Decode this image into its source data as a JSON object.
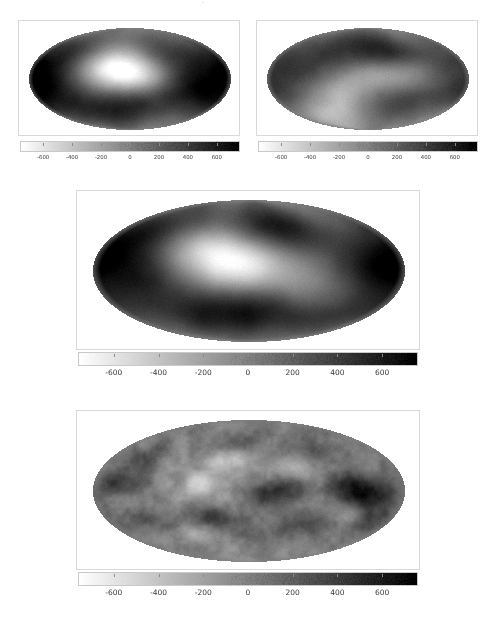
{
  "figure": {
    "background": "#ffffff",
    "top_mark": "·",
    "colormap": {
      "name": "gray-reversed",
      "low_color": "#ffffff",
      "high_color": "#000000",
      "description": "white at negative values, black at positive values"
    }
  },
  "chart_data": [
    {
      "id": "panel-top-left",
      "type": "heatmap",
      "projection": "mollweide",
      "title": "",
      "xlabel": "",
      "ylabel": "",
      "units": "µK",
      "grid": false,
      "frame": {
        "x": 18,
        "y": 20,
        "width": 222,
        "height": 116
      },
      "ellipse": {
        "cx": 111,
        "cy": 58,
        "rx": 101,
        "ry": 51
      },
      "zlim": [
        -750,
        750
      ],
      "colorbar": {
        "x": 20,
        "y": 141,
        "width": 220,
        "height": 11,
        "orientation": "horizontal",
        "ticks": [
          -600,
          -400,
          -200,
          0,
          200,
          400,
          600
        ],
        "tick_labels": [
          "-600",
          "-400",
          "-200",
          "0",
          "200",
          "400",
          "600"
        ],
        "range": [
          -760,
          760
        ],
        "font_size": 5.4
      },
      "noise_amp": 60,
      "noise_scale": 0.9,
      "blobs": [
        {
          "lon": -0.18,
          "lat": -0.08,
          "amp": -620,
          "sx": 0.3,
          "sy": 0.34
        },
        {
          "lon": -0.06,
          "lat": -0.3,
          "amp": -430,
          "sx": 0.26,
          "sy": 0.26
        },
        {
          "lon": 0.02,
          "lat": 0.46,
          "amp": 520,
          "sx": 0.36,
          "sy": 0.3
        },
        {
          "lon": -0.7,
          "lat": 0.1,
          "amp": 470,
          "sx": 0.3,
          "sy": 0.38
        },
        {
          "lon": 0.66,
          "lat": 0.06,
          "amp": 520,
          "sx": 0.28,
          "sy": 0.34
        },
        {
          "lon": -0.92,
          "lat": -0.3,
          "amp": 430,
          "sx": 0.26,
          "sy": 0.3
        },
        {
          "lon": 0.34,
          "lat": -0.52,
          "amp": 330,
          "sx": 0.34,
          "sy": 0.26
        },
        {
          "lon": -0.34,
          "lat": 0.72,
          "amp": 260,
          "sx": 0.34,
          "sy": 0.24
        },
        {
          "lon": 0.92,
          "lat": 0.46,
          "amp": 300,
          "sx": 0.26,
          "sy": 0.26
        },
        {
          "lon": -0.5,
          "lat": -0.66,
          "amp": 280,
          "sx": 0.3,
          "sy": 0.24
        },
        {
          "lon": 0.14,
          "lat": 0.02,
          "amp": -260,
          "sx": 0.18,
          "sy": 0.2
        }
      ]
    },
    {
      "id": "panel-top-right",
      "type": "heatmap",
      "projection": "mollweide",
      "title": "",
      "xlabel": "",
      "ylabel": "",
      "units": "µK",
      "grid": false,
      "frame": {
        "x": 256,
        "y": 20,
        "width": 222,
        "height": 116
      },
      "ellipse": {
        "cx": 111,
        "cy": 58,
        "rx": 101,
        "ry": 51
      },
      "zlim": [
        -750,
        750
      ],
      "colorbar": {
        "x": 258,
        "y": 141,
        "width": 220,
        "height": 11,
        "orientation": "horizontal",
        "ticks": [
          -600,
          -400,
          -200,
          0,
          200,
          400,
          600
        ],
        "tick_labels": [
          "-600",
          "-400",
          "-200",
          "0",
          "200",
          "400",
          "600"
        ],
        "range": [
          -760,
          760
        ],
        "font_size": 5.4
      },
      "noise_amp": 60,
      "noise_scale": 0.9,
      "blobs": [
        {
          "lon": 0.2,
          "lat": 0.44,
          "amp": 560,
          "sx": 0.3,
          "sy": 0.3
        },
        {
          "lon": 0.2,
          "lat": -0.52,
          "amp": 620,
          "sx": 0.28,
          "sy": 0.26
        },
        {
          "lon": -0.52,
          "lat": -0.22,
          "amp": 420,
          "sx": 0.34,
          "sy": 0.34
        },
        {
          "lon": 0.74,
          "lat": 0.1,
          "amp": 320,
          "sx": 0.3,
          "sy": 0.36
        },
        {
          "lon": -0.92,
          "lat": 0.34,
          "amp": 300,
          "sx": 0.26,
          "sy": 0.3
        },
        {
          "lon": -0.2,
          "lat": 0.3,
          "amp": -470,
          "sx": 0.34,
          "sy": 0.34
        },
        {
          "lon": 0.52,
          "lat": -0.1,
          "amp": -330,
          "sx": 0.3,
          "sy": 0.34
        },
        {
          "lon": -0.66,
          "lat": 0.7,
          "amp": -300,
          "sx": 0.34,
          "sy": 0.24
        },
        {
          "lon": 0.04,
          "lat": -0.12,
          "amp": -230,
          "sx": 0.26,
          "sy": 0.26
        },
        {
          "lon": 0.9,
          "lat": -0.4,
          "amp": 260,
          "sx": 0.26,
          "sy": 0.26
        },
        {
          "lon": -0.34,
          "lat": -0.74,
          "amp": 230,
          "sx": 0.3,
          "sy": 0.22
        }
      ]
    },
    {
      "id": "panel-middle",
      "type": "heatmap",
      "projection": "mollweide",
      "title": "",
      "xlabel": "",
      "ylabel": "",
      "units": "µK",
      "grid": false,
      "frame": {
        "x": 76,
        "y": 190,
        "width": 344,
        "height": 160
      },
      "ellipse": {
        "cx": 172,
        "cy": 80,
        "rx": 156,
        "ry": 71
      },
      "zlim": [
        -750,
        750
      ],
      "colorbar": {
        "x": 78,
        "y": 352,
        "width": 340,
        "height": 14,
        "orientation": "horizontal",
        "ticks": [
          -600,
          -400,
          -200,
          0,
          200,
          400,
          600
        ],
        "tick_labels": [
          "-600",
          "-400",
          "-200",
          "0",
          "200",
          "400",
          "600"
        ],
        "range": [
          -760,
          760
        ],
        "font_size": 7.5
      },
      "noise_amp": 55,
      "noise_scale": 1.0,
      "blobs": [
        {
          "lon": -0.1,
          "lat": -0.05,
          "amp": -700,
          "sx": 0.26,
          "sy": 0.28
        },
        {
          "lon": -0.28,
          "lat": -0.34,
          "amp": -400,
          "sx": 0.24,
          "sy": 0.22
        },
        {
          "lon": 0.06,
          "lat": 0.52,
          "amp": 620,
          "sx": 0.34,
          "sy": 0.28
        },
        {
          "lon": 0.22,
          "lat": -0.56,
          "amp": 600,
          "sx": 0.26,
          "sy": 0.24
        },
        {
          "lon": 0.8,
          "lat": 0.0,
          "amp": 620,
          "sx": 0.24,
          "sy": 0.32
        },
        {
          "lon": -0.62,
          "lat": 0.1,
          "amp": 470,
          "sx": 0.26,
          "sy": 0.32
        },
        {
          "lon": -0.88,
          "lat": -0.34,
          "amp": 420,
          "sx": 0.24,
          "sy": 0.28
        },
        {
          "lon": -0.4,
          "lat": 0.68,
          "amp": 300,
          "sx": 0.3,
          "sy": 0.22
        },
        {
          "lon": 0.46,
          "lat": 0.3,
          "amp": -330,
          "sx": 0.26,
          "sy": 0.26
        },
        {
          "lon": -0.72,
          "lat": -0.66,
          "amp": 280,
          "sx": 0.28,
          "sy": 0.22
        },
        {
          "lon": 0.56,
          "lat": 0.68,
          "amp": 260,
          "sx": 0.26,
          "sy": 0.2
        },
        {
          "lon": -0.04,
          "lat": -0.8,
          "amp": 240,
          "sx": 0.3,
          "sy": 0.2
        },
        {
          "lon": 0.92,
          "lat": 0.5,
          "amp": 230,
          "sx": 0.22,
          "sy": 0.24
        }
      ]
    },
    {
      "id": "panel-bottom",
      "type": "heatmap",
      "projection": "mollweide",
      "title": "",
      "xlabel": "",
      "ylabel": "",
      "units": "µK",
      "grid": false,
      "frame": {
        "x": 76,
        "y": 410,
        "width": 344,
        "height": 160
      },
      "ellipse": {
        "cx": 172,
        "cy": 80,
        "rx": 156,
        "ry": 71
      },
      "zlim": [
        -750,
        750
      ],
      "colorbar": {
        "x": 78,
        "y": 572,
        "width": 340,
        "height": 14,
        "orientation": "horizontal",
        "ticks": [
          -600,
          -400,
          -200,
          0,
          200,
          400,
          600
        ],
        "tick_labels": [
          "-600",
          "-400",
          "-200",
          "0",
          "200",
          "400",
          "600"
        ],
        "range": [
          -760,
          760
        ],
        "font_size": 7.5
      },
      "noise_amp": 120,
      "noise_scale": 3.4,
      "blobs": [
        {
          "lon": 0.72,
          "lat": 0.02,
          "amp": 700,
          "sx": 0.14,
          "sy": 0.18
        },
        {
          "lon": 0.16,
          "lat": 0.02,
          "amp": 500,
          "sx": 0.14,
          "sy": 0.14
        },
        {
          "lon": -0.22,
          "lat": 0.4,
          "amp": 360,
          "sx": 0.12,
          "sy": 0.12
        },
        {
          "lon": 0.4,
          "lat": 0.44,
          "amp": 330,
          "sx": 0.14,
          "sy": 0.12
        },
        {
          "lon": -0.62,
          "lat": 0.46,
          "amp": 300,
          "sx": 0.12,
          "sy": 0.12
        },
        {
          "lon": -0.86,
          "lat": -0.1,
          "amp": 300,
          "sx": 0.12,
          "sy": 0.16
        },
        {
          "lon": 0.9,
          "lat": 0.4,
          "amp": 260,
          "sx": 0.12,
          "sy": 0.14
        },
        {
          "lon": -0.3,
          "lat": -0.1,
          "amp": -420,
          "sx": 0.12,
          "sy": 0.14
        },
        {
          "lon": -0.12,
          "lat": -0.44,
          "amp": -460,
          "sx": 0.12,
          "sy": 0.12
        },
        {
          "lon": -0.44,
          "lat": 0.58,
          "amp": -340,
          "sx": 0.12,
          "sy": 0.1
        },
        {
          "lon": 0.3,
          "lat": -0.3,
          "amp": -280,
          "sx": 0.12,
          "sy": 0.12
        },
        {
          "lon": 0.6,
          "lat": 0.3,
          "amp": -260,
          "sx": 0.12,
          "sy": 0.1
        },
        {
          "lon": -0.76,
          "lat": -0.48,
          "amp": 240,
          "sx": 0.12,
          "sy": 0.12
        },
        {
          "lon": 0.04,
          "lat": 0.62,
          "amp": 220,
          "sx": 0.14,
          "sy": 0.12
        },
        {
          "lon": 0.48,
          "lat": -0.6,
          "amp": 220,
          "sx": 0.14,
          "sy": 0.12
        },
        {
          "lon": -0.06,
          "lat": -0.68,
          "amp": 200,
          "sx": 0.14,
          "sy": 0.12
        }
      ]
    }
  ]
}
